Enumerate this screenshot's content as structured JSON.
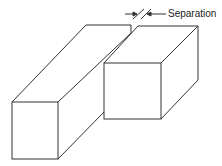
{
  "diagram": {
    "label": "Separation",
    "stroke_color": "#333333",
    "background": "#ffffff"
  }
}
